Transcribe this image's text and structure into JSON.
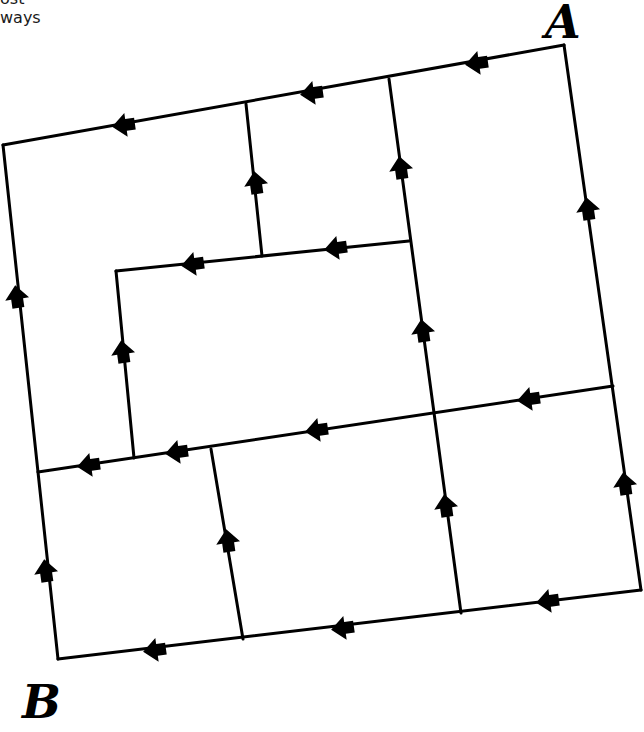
{
  "caption": {
    "line1": "ost",
    "line2": "ways"
  },
  "labels": {
    "start": "A",
    "end": "B"
  },
  "colors": {
    "line": "#000000",
    "background": "#ffffff"
  },
  "nodes": {
    "A_corner": [
      564,
      45
    ],
    "top_left": [
      3,
      145
    ],
    "bottom_right": [
      641,
      590
    ],
    "B_corner": [
      58,
      659
    ]
  },
  "edges": [
    {
      "from": [
        564,
        45
      ],
      "to": [
        3,
        145
      ]
    },
    {
      "from": [
        3,
        145
      ],
      "to": [
        58,
        659
      ]
    },
    {
      "from": [
        564,
        45
      ],
      "to": [
        641,
        590
      ]
    },
    {
      "from": [
        641,
        590
      ],
      "to": [
        58,
        659
      ]
    },
    {
      "from": [
        246,
        104
      ],
      "to": [
        262,
        256
      ]
    },
    {
      "from": [
        389,
        79
      ],
      "to": [
        461,
        613
      ]
    },
    {
      "from": [
        409,
        241
      ],
      "to": [
        116,
        271
      ]
    },
    {
      "from": [
        116,
        271
      ],
      "to": [
        134,
        458
      ]
    },
    {
      "from": [
        613,
        386
      ],
      "to": [
        38,
        472
      ]
    },
    {
      "from": [
        211,
        449
      ],
      "to": [
        243,
        639
      ]
    }
  ],
  "arrows": [
    {
      "x": 478,
      "y": 63,
      "dir": "left"
    },
    {
      "x": 313,
      "y": 93,
      "dir": "left"
    },
    {
      "x": 125,
      "y": 125,
      "dir": "left"
    },
    {
      "x": 256,
      "y": 184,
      "dir": "down"
    },
    {
      "x": 401,
      "y": 169,
      "dir": "down"
    },
    {
      "x": 588,
      "y": 210,
      "dir": "down"
    },
    {
      "x": 337,
      "y": 248,
      "dir": "left"
    },
    {
      "x": 194,
      "y": 264,
      "dir": "left"
    },
    {
      "x": 17,
      "y": 298,
      "dir": "down"
    },
    {
      "x": 123,
      "y": 353,
      "dir": "down"
    },
    {
      "x": 423,
      "y": 332,
      "dir": "down"
    },
    {
      "x": 530,
      "y": 399,
      "dir": "left"
    },
    {
      "x": 318,
      "y": 430,
      "dir": "left"
    },
    {
      "x": 178,
      "y": 452,
      "dir": "left"
    },
    {
      "x": 90,
      "y": 465,
      "dir": "left"
    },
    {
      "x": 625,
      "y": 485,
      "dir": "down"
    },
    {
      "x": 446,
      "y": 507,
      "dir": "down"
    },
    {
      "x": 228,
      "y": 542,
      "dir": "down"
    },
    {
      "x": 46,
      "y": 572,
      "dir": "down"
    },
    {
      "x": 549,
      "y": 601,
      "dir": "left"
    },
    {
      "x": 344,
      "y": 628,
      "dir": "left"
    },
    {
      "x": 156,
      "y": 650,
      "dir": "left"
    }
  ]
}
